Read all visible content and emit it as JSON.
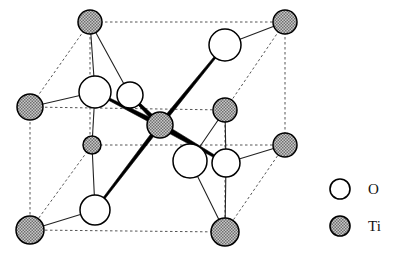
{
  "figure": {
    "kind": "crystal-structure-diagram",
    "width": 394,
    "height": 258,
    "background_color": "#ffffff"
  },
  "legend": {
    "items": [
      {
        "key": "O",
        "label": "O",
        "symbol": "open-circle",
        "fill": "#ffffff",
        "stroke": "#000000",
        "cx": 340,
        "cy": 189,
        "r": 10
      },
      {
        "key": "Ti",
        "label": "Ti",
        "symbol": "hatched-circle",
        "fill": "#9a9a9a",
        "stroke": "#000000",
        "cx": 340,
        "cy": 226,
        "r": 10
      }
    ],
    "label_x": 368,
    "label_o_y": 194,
    "label_ti_y": 231
  },
  "colors": {
    "oxygen_fill": "#ffffff",
    "titanium_fill": "#9e9e9e",
    "atom_stroke": "#000000",
    "cell_edge": "#555555",
    "thin_bond": "#222222",
    "thick_bond": "#000000"
  },
  "cell_edges": [
    {
      "name": "edge-top-back",
      "x1": 90,
      "y1": 22,
      "x2": 285,
      "y2": 22,
      "style": "dashed"
    },
    {
      "name": "edge-back-left-vertical",
      "x1": 90,
      "y1": 22,
      "x2": 90,
      "y2": 145,
      "style": "dashed"
    },
    {
      "name": "edge-back-right-vertical",
      "x1": 285,
      "y1": 22,
      "x2": 285,
      "y2": 145,
      "style": "dashed"
    },
    {
      "name": "edge-mid-horizontal",
      "x1": 90,
      "y1": 145,
      "x2": 285,
      "y2": 145,
      "style": "dashed"
    },
    {
      "name": "edge-top-left-diagonal",
      "x1": 90,
      "y1": 22,
      "x2": 30,
      "y2": 107,
      "style": "dashed"
    },
    {
      "name": "edge-top-right-diagonal",
      "x1": 285,
      "y1": 22,
      "x2": 225,
      "y2": 110,
      "style": "dashed"
    },
    {
      "name": "edge-front-top",
      "x1": 30,
      "y1": 107,
      "x2": 225,
      "y2": 110,
      "style": "dashed"
    },
    {
      "name": "edge-front-left-vertical",
      "x1": 30,
      "y1": 107,
      "x2": 30,
      "y2": 230,
      "style": "dashed"
    },
    {
      "name": "edge-front-right-vertical",
      "x1": 225,
      "y1": 110,
      "x2": 225,
      "y2": 232,
      "style": "dashed"
    },
    {
      "name": "edge-front-bottom",
      "x1": 30,
      "y1": 230,
      "x2": 225,
      "y2": 232,
      "style": "dashed"
    },
    {
      "name": "edge-bottom-left-diagonal",
      "x1": 30,
      "y1": 230,
      "x2": 92,
      "y2": 145,
      "style": "dashed"
    },
    {
      "name": "edge-bottom-right-diagonal",
      "x1": 225,
      "y1": 232,
      "x2": 285,
      "y2": 145,
      "style": "dashed"
    }
  ],
  "atoms": [
    {
      "id": "ti-back-top-left",
      "element": "Ti",
      "cx": 90,
      "cy": 22,
      "r": 12
    },
    {
      "id": "ti-back-top-right",
      "element": "Ti",
      "cx": 285,
      "cy": 22,
      "r": 12
    },
    {
      "id": "ti-front-top-left",
      "element": "Ti",
      "cx": 30,
      "cy": 107,
      "r": 13
    },
    {
      "id": "ti-back-mid-right",
      "element": "Ti",
      "cx": 225,
      "cy": 110,
      "r": 12
    },
    {
      "id": "ti-interior-left",
      "element": "Ti",
      "cx": 92,
      "cy": 145,
      "r": 9
    },
    {
      "id": "ti-center",
      "element": "Ti",
      "cx": 160,
      "cy": 125,
      "r": 13
    },
    {
      "id": "ti-front-mid-right",
      "element": "Ti",
      "cx": 285,
      "cy": 145,
      "r": 12
    },
    {
      "id": "ti-front-bottom-left",
      "element": "Ti",
      "cx": 30,
      "cy": 230,
      "r": 14
    },
    {
      "id": "ti-front-bottom-right",
      "element": "Ti",
      "cx": 225,
      "cy": 232,
      "r": 14
    },
    {
      "id": "o-upper-left-large",
      "element": "O",
      "cx": 95,
      "cy": 92,
      "r": 16
    },
    {
      "id": "o-upper-left-small",
      "element": "O",
      "cx": 130,
      "cy": 95,
      "r": 13
    },
    {
      "id": "o-top-center",
      "element": "O",
      "cx": 225,
      "cy": 45,
      "r": 16
    },
    {
      "id": "o-lower-right-large",
      "element": "O",
      "cx": 190,
      "cy": 161,
      "r": 17
    },
    {
      "id": "o-lower-right-small",
      "element": "O",
      "cx": 226,
      "cy": 163,
      "r": 14
    },
    {
      "id": "o-bottom-left",
      "element": "O",
      "cx": 95,
      "cy": 210,
      "r": 15
    }
  ],
  "thin_bonds": [
    {
      "name": "bond-ti-backtopleft-to-o-upperleft",
      "x1": 90,
      "y1": 22,
      "x2": 95,
      "y2": 92
    },
    {
      "name": "bond-ti-backtopleft-to-o-upperleft2",
      "x1": 90,
      "y1": 22,
      "x2": 130,
      "y2": 95
    },
    {
      "name": "bond-ti-fronttopleft-to-o-upperleft",
      "x1": 30,
      "y1": 107,
      "x2": 95,
      "y2": 92
    },
    {
      "name": "bond-o-upperleft-to-ti-interiorleft",
      "x1": 95,
      "y1": 92,
      "x2": 92,
      "y2": 145
    },
    {
      "name": "bond-ti-interiorleft-to-o-bottomleft",
      "x1": 92,
      "y1": 145,
      "x2": 95,
      "y2": 210
    },
    {
      "name": "bond-o-bottomleft-to-ti-bottomleft",
      "x1": 95,
      "y1": 210,
      "x2": 30,
      "y2": 230
    },
    {
      "name": "bond-o-topcenter-to-ti-backtopright",
      "x1": 225,
      "y1": 45,
      "x2": 285,
      "y2": 22
    },
    {
      "name": "bond-ti-backmidright-to-o-lowerright",
      "x1": 225,
      "y1": 110,
      "x2": 190,
      "y2": 161
    },
    {
      "name": "bond-ti-backmidright-to-o-lowerright2",
      "x1": 225,
      "y1": 110,
      "x2": 226,
      "y2": 163
    },
    {
      "name": "bond-o-lowerrightsmall-to-ti-midright",
      "x1": 226,
      "y1": 163,
      "x2": 285,
      "y2": 145
    },
    {
      "name": "bond-o-lowerright-to-ti-frontbottomright",
      "x1": 190,
      "y1": 161,
      "x2": 225,
      "y2": 232
    },
    {
      "name": "bond-o-lowerrightsmall-to-ti-frontbottomright",
      "x1": 226,
      "y1": 163,
      "x2": 225,
      "y2": 232
    }
  ],
  "highlight_bonds": [
    {
      "name": "highlight-center-to-o-upper-left",
      "x1": 160,
      "y1": 125,
      "x2": 95,
      "y2": 92,
      "width": 5
    },
    {
      "name": "highlight-center-to-o-upper-left2",
      "x1": 160,
      "y1": 125,
      "x2": 130,
      "y2": 95,
      "width": 5
    },
    {
      "name": "highlight-center-to-o-top-center",
      "x1": 160,
      "y1": 125,
      "x2": 225,
      "y2": 45,
      "width": 4
    },
    {
      "name": "highlight-center-to-o-lower-right",
      "x1": 160,
      "y1": 125,
      "x2": 226,
      "y2": 163,
      "width": 6
    },
    {
      "name": "highlight-center-to-o-bottom-left",
      "x1": 160,
      "y1": 125,
      "x2": 95,
      "y2": 210,
      "width": 4
    }
  ]
}
